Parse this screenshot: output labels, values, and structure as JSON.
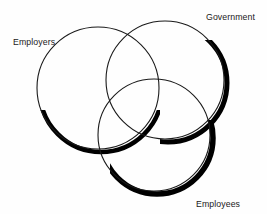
{
  "diagram": {
    "type": "venn",
    "title": "",
    "background_color": "#fefefe",
    "stroke_color": "#1a1a1a",
    "shadow_color": "#000000",
    "label_color": "#1a1a1a",
    "sets": [
      {
        "id": "employers",
        "label": "Employers",
        "cx": 98,
        "cy": 88,
        "r": 61,
        "label_x": 13,
        "label_y": 36
      },
      {
        "id": "government",
        "label": "Government",
        "cx": 165,
        "cy": 80,
        "r": 59,
        "label_x": 206,
        "label_y": 11
      },
      {
        "id": "employees",
        "label": "Employees",
        "cx": 154,
        "cy": 135,
        "r": 56,
        "label_x": 196,
        "label_y": 198
      }
    ]
  }
}
